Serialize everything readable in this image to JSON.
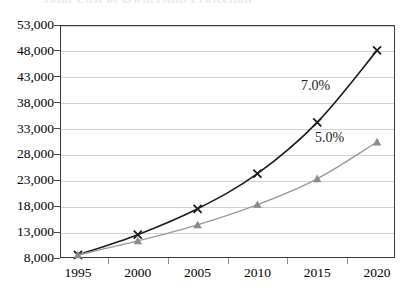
{
  "figure": {
    "title_remnant": "Total Cost of Ownership Projection",
    "background_color": "#ffffff",
    "frame_color": "#3a3a3a",
    "gridline_color": "#d2d2d6"
  },
  "chart_data": {
    "type": "line",
    "title": "",
    "subtitle": "",
    "xlabel": "",
    "ylabel": "",
    "x": [
      1995,
      2000,
      2005,
      2010,
      2015,
      2020
    ],
    "xtick_labels": [
      "1995",
      "2000",
      "2005",
      "2010",
      "2015",
      "2020"
    ],
    "ytick_labels": [
      "8,000",
      "13,000",
      "18,000",
      "23,000",
      "28,000",
      "33,000",
      "38,000",
      "43,000",
      "48,000",
      "53,000"
    ],
    "ytick_values": [
      8000,
      13000,
      18000,
      23000,
      28000,
      33000,
      38000,
      43000,
      48000,
      53000
    ],
    "ylim": [
      8000,
      53000
    ],
    "xlim": [
      1993.5,
      2021.5
    ],
    "grid": "horizontal",
    "legend_position": "none",
    "series": [
      {
        "name": "7.0%",
        "color": "#1d1d1d",
        "marker": "x",
        "marker_color": "#1d1d1d",
        "line_width": 1.6,
        "values": [
          8600,
          12500,
          17500,
          24300,
          34200,
          48100
        ]
      },
      {
        "name": "5.0%",
        "color": "#9a9a9a",
        "marker": "triangle",
        "marker_color": "#8b8b8b",
        "line_width": 1.4,
        "values": [
          8600,
          11300,
          14400,
          18300,
          23300,
          30400
        ]
      }
    ],
    "annotations": [
      {
        "text": "7.0%",
        "x_px": 301,
        "y_px": 79,
        "color": "#1d1d1d"
      },
      {
        "text": "5.0%",
        "x_px": 315,
        "y_px": 131,
        "color": "#1d1d1d"
      }
    ]
  }
}
